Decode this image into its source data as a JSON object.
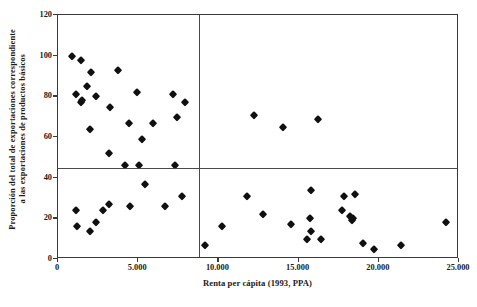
{
  "chart_data": {
    "type": "scatter",
    "title": "",
    "xlabel": "Renta per cápita (1993, PPA)",
    "ylabel_line1": "Proporción del total de exportaciones correspondiente",
    "ylabel_line2": "a las exportaciones de productos básicos",
    "xlim": [
      0,
      25000
    ],
    "ylim": [
      0,
      120
    ],
    "xticks": [
      0,
      5000,
      10000,
      15000,
      20000,
      25000
    ],
    "xtick_labels": [
      "0",
      "5.000",
      "10.000",
      "15.000",
      "20.000",
      "25.000"
    ],
    "yticks": [
      0,
      20,
      40,
      60,
      80,
      100,
      120
    ],
    "ytick_labels": [
      "0",
      "20",
      "40",
      "60",
      "80",
      "100",
      "120"
    ],
    "grid": false,
    "legend": null,
    "marker": "diamond",
    "marker_color": "#101010",
    "frame_color": "#3a3a3a",
    "reference_lines": [
      {
        "orientation": "vertical",
        "value": 8800
      },
      {
        "orientation": "horizontal",
        "value": 45
      }
    ],
    "points": [
      {
        "x": 850,
        "y": 100
      },
      {
        "x": 1450,
        "y": 98
      },
      {
        "x": 2050,
        "y": 92
      },
      {
        "x": 1800,
        "y": 85
      },
      {
        "x": 1150,
        "y": 81
      },
      {
        "x": 1500,
        "y": 78
      },
      {
        "x": 1450,
        "y": 77
      },
      {
        "x": 2350,
        "y": 80
      },
      {
        "x": 3750,
        "y": 93
      },
      {
        "x": 4950,
        "y": 82
      },
      {
        "x": 2000,
        "y": 64
      },
      {
        "x": 3250,
        "y": 75
      },
      {
        "x": 4400,
        "y": 67
      },
      {
        "x": 5900,
        "y": 67
      },
      {
        "x": 7200,
        "y": 81
      },
      {
        "x": 7400,
        "y": 70
      },
      {
        "x": 7900,
        "y": 77
      },
      {
        "x": 3150,
        "y": 52
      },
      {
        "x": 5250,
        "y": 59
      },
      {
        "x": 4150,
        "y": 46
      },
      {
        "x": 5050,
        "y": 46
      },
      {
        "x": 7300,
        "y": 46
      },
      {
        "x": 12200,
        "y": 71
      },
      {
        "x": 14000,
        "y": 65
      },
      {
        "x": 16200,
        "y": 69
      },
      {
        "x": 1150,
        "y": 24
      },
      {
        "x": 1200,
        "y": 16
      },
      {
        "x": 2000,
        "y": 14
      },
      {
        "x": 2350,
        "y": 18
      },
      {
        "x": 2800,
        "y": 24
      },
      {
        "x": 3200,
        "y": 27
      },
      {
        "x": 4500,
        "y": 26
      },
      {
        "x": 5450,
        "y": 37
      },
      {
        "x": 6700,
        "y": 26
      },
      {
        "x": 7750,
        "y": 31
      },
      {
        "x": 9150,
        "y": 7
      },
      {
        "x": 10200,
        "y": 16
      },
      {
        "x": 11800,
        "y": 31
      },
      {
        "x": 12800,
        "y": 22
      },
      {
        "x": 14500,
        "y": 17
      },
      {
        "x": 15700,
        "y": 20
      },
      {
        "x": 15750,
        "y": 14
      },
      {
        "x": 15500,
        "y": 10
      },
      {
        "x": 16400,
        "y": 10
      },
      {
        "x": 15800,
        "y": 34
      },
      {
        "x": 17800,
        "y": 31
      },
      {
        "x": 18500,
        "y": 32
      },
      {
        "x": 17700,
        "y": 24
      },
      {
        "x": 18200,
        "y": 21
      },
      {
        "x": 18300,
        "y": 19
      },
      {
        "x": 18400,
        "y": 20
      },
      {
        "x": 19000,
        "y": 8
      },
      {
        "x": 19700,
        "y": 5
      },
      {
        "x": 21400,
        "y": 7
      },
      {
        "x": 24200,
        "y": 18
      }
    ]
  }
}
